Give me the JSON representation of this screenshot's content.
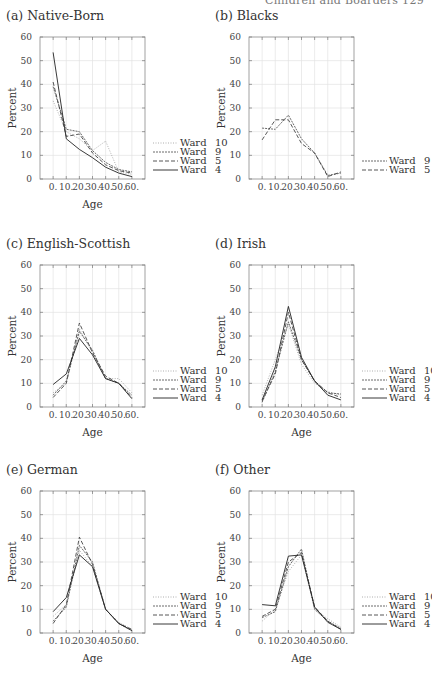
{
  "page": {
    "running_head": "Children and Boarders   129"
  },
  "legend_styles": {
    "Ward 10": {
      "dash": "1,1.5",
      "color": "#9a9a9a",
      "width": 0.8
    },
    "Ward 9": {
      "dash": "2,1",
      "color": "#444444",
      "width": 0.8
    },
    "Ward 5": {
      "dash": "4,2",
      "color": "#444444",
      "width": 0.9
    },
    "Ward 4": {
      "dash": "",
      "color": "#222222",
      "width": 0.9
    }
  },
  "chart_data": [
    {
      "id": "a",
      "type": "line",
      "title": "(a) Native-Born",
      "xlabel": "Age",
      "ylabel": "Percent",
      "x": [
        0,
        10,
        20,
        30,
        40,
        50,
        60
      ],
      "xtick_labels": [
        "0.",
        "10.",
        "20.",
        "30.",
        "40.",
        "50.",
        "60."
      ],
      "yticks": [
        0,
        10,
        20,
        30,
        40,
        50,
        60
      ],
      "ylim": [
        0,
        60
      ],
      "xlim": [
        -10,
        70
      ],
      "grid": true,
      "legend_position": "right-bottom",
      "series": [
        {
          "name": "Ward 10",
          "values": [
            33,
            20,
            17,
            12,
            16,
            3,
            2
          ]
        },
        {
          "name": "Ward 9",
          "values": [
            39,
            21,
            20,
            12,
            7,
            4,
            3
          ]
        },
        {
          "name": "Ward 5",
          "values": [
            41,
            18,
            19,
            11,
            6,
            3.5,
            2.5
          ]
        },
        {
          "name": "Ward 4",
          "values": [
            53.5,
            17,
            12.5,
            9,
            5,
            2.5,
            1
          ]
        }
      ]
    },
    {
      "id": "b",
      "type": "line",
      "title": "(b) Blacks",
      "xlabel": "",
      "ylabel": "Percent",
      "x": [
        0,
        10,
        20,
        30,
        40,
        50,
        60
      ],
      "xtick_labels": [
        "0.",
        "10.",
        "20.",
        "30.",
        "40.",
        "50.",
        "60."
      ],
      "yticks": [
        0,
        10,
        20,
        30,
        40,
        50,
        60
      ],
      "ylim": [
        0,
        60
      ],
      "xlim": [
        -10,
        70
      ],
      "grid": true,
      "legend_position": "right-bottom",
      "series": [
        {
          "name": "Ward 9",
          "values": [
            21.5,
            21,
            27,
            17,
            11,
            1.5,
            2.5
          ]
        },
        {
          "name": "Ward 5",
          "values": [
            16.5,
            25,
            25,
            15,
            11,
            1,
            3
          ]
        }
      ]
    },
    {
      "id": "c",
      "type": "line",
      "title": "(c) English-Scottish",
      "xlabel": "Age",
      "ylabel": "Percent",
      "x": [
        0,
        10,
        20,
        30,
        40,
        50,
        60
      ],
      "xtick_labels": [
        "0.",
        "10.",
        "20.",
        "30.",
        "40.",
        "50.",
        "60."
      ],
      "yticks": [
        0,
        10,
        20,
        30,
        40,
        50,
        60
      ],
      "ylim": [
        0,
        60
      ],
      "xlim": [
        -10,
        70
      ],
      "grid": true,
      "legend_position": "right-bottom",
      "series": [
        {
          "name": "Ward 10",
          "values": [
            6,
            10,
            33,
            23,
            12,
            12,
            6
          ]
        },
        {
          "name": "Ward 9",
          "values": [
            5,
            11,
            32,
            24,
            12,
            10,
            5
          ]
        },
        {
          "name": "Ward 5",
          "values": [
            4,
            10,
            35.5,
            23,
            13,
            10,
            4
          ]
        },
        {
          "name": "Ward 4",
          "values": [
            9.5,
            14,
            29,
            22,
            12,
            10,
            3.5
          ]
        }
      ]
    },
    {
      "id": "d",
      "type": "line",
      "title": "(d) Irish",
      "xlabel": "Age",
      "ylabel": "Percent",
      "x": [
        0,
        10,
        20,
        30,
        40,
        50,
        60
      ],
      "xtick_labels": [
        "0.",
        "10.",
        "20.",
        "30.",
        "40.",
        "50.",
        "60."
      ],
      "yticks": [
        0,
        10,
        20,
        30,
        40,
        50,
        60
      ],
      "ylim": [
        0,
        60
      ],
      "xlim": [
        -10,
        70
      ],
      "grid": true,
      "legend_position": "right-bottom",
      "series": [
        {
          "name": "Ward 10",
          "values": [
            5,
            20,
            35,
            18,
            10,
            6.5,
            5
          ]
        },
        {
          "name": "Ward 9",
          "values": [
            2,
            15,
            36,
            20,
            11,
            6,
            5.5
          ]
        },
        {
          "name": "Ward 5",
          "values": [
            2.5,
            14,
            40,
            20,
            11,
            6,
            4
          ]
        },
        {
          "name": "Ward 4",
          "values": [
            3,
            17,
            42.5,
            21,
            11,
            5,
            3
          ]
        }
      ]
    },
    {
      "id": "e",
      "type": "line",
      "title": "(e) German",
      "xlabel": "Age",
      "ylabel": "Percent",
      "x": [
        0,
        10,
        20,
        30,
        40,
        50,
        60
      ],
      "xtick_labels": [
        "0.",
        "10.",
        "20.",
        "30.",
        "40.",
        "50.",
        "60."
      ],
      "yticks": [
        0,
        10,
        20,
        30,
        40,
        50,
        60
      ],
      "ylim": [
        0,
        60
      ],
      "xlim": [
        -10,
        70
      ],
      "grid": true,
      "legend_position": "right-bottom",
      "series": [
        {
          "name": "Ward 10",
          "values": [
            7,
            12,
            35,
            28,
            10,
            4.5,
            1.5
          ]
        },
        {
          "name": "Ward 9",
          "values": [
            5,
            11,
            37,
            30,
            10,
            4,
            1
          ]
        },
        {
          "name": "Ward 5",
          "values": [
            4,
            12,
            40.5,
            29,
            10,
            4,
            1.5
          ]
        },
        {
          "name": "Ward 4",
          "values": [
            9,
            15,
            33,
            28,
            10,
            4,
            1
          ]
        }
      ]
    },
    {
      "id": "f",
      "type": "line",
      "title": "(f) Other",
      "xlabel": "Age",
      "ylabel": "Percent",
      "x": [
        0,
        10,
        20,
        30,
        40,
        50,
        60
      ],
      "xtick_labels": [
        "0.",
        "10.",
        "20.",
        "30.",
        "40.",
        "50.",
        "60."
      ],
      "yticks": [
        0,
        10,
        20,
        30,
        40,
        50,
        60
      ],
      "ylim": [
        0,
        60
      ],
      "xlim": [
        -10,
        70
      ],
      "grid": true,
      "legend_position": "right-bottom",
      "series": [
        {
          "name": "Ward 10",
          "values": [
            5,
            10,
            26,
            33,
            10,
            6,
            2.5
          ]
        },
        {
          "name": "Ward 9",
          "values": [
            6.5,
            9,
            28,
            35.5,
            10,
            5,
            2
          ]
        },
        {
          "name": "Ward 5",
          "values": [
            7,
            10,
            30,
            34,
            11,
            5,
            1.5
          ]
        },
        {
          "name": "Ward 4",
          "values": [
            12,
            11.5,
            32.5,
            33,
            11,
            4.5,
            1.5
          ]
        }
      ]
    }
  ]
}
